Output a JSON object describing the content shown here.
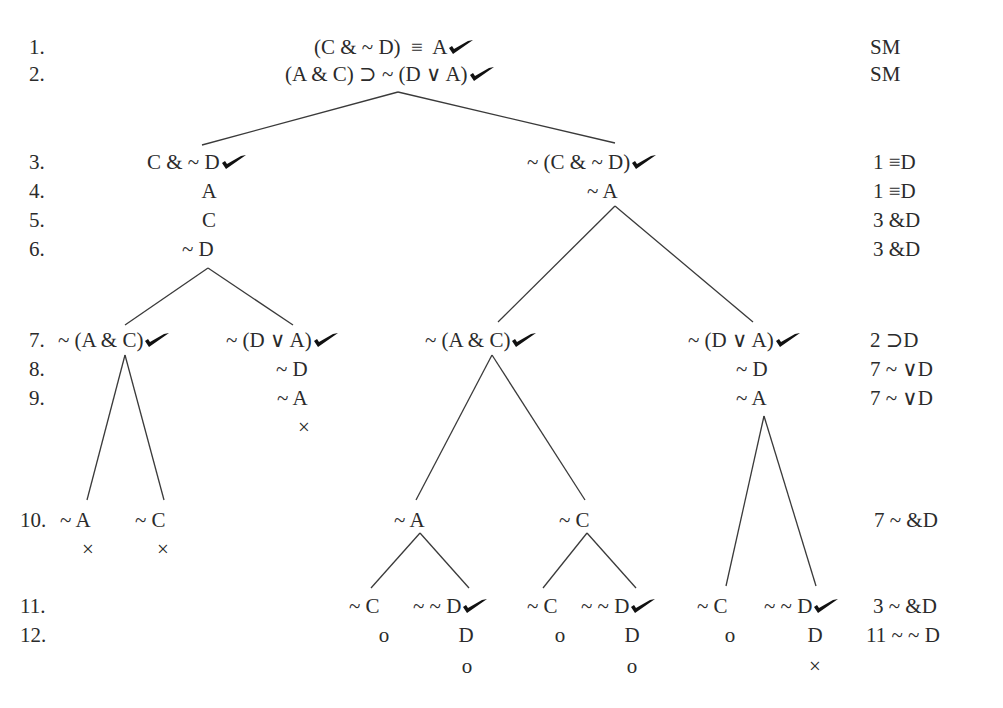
{
  "lines": [
    {
      "num": "1.",
      "justification": "SM"
    },
    {
      "num": "2.",
      "justification": "SM"
    },
    {
      "num": "3.",
      "justification": "1 ≡D"
    },
    {
      "num": "4.",
      "justification": "1 ≡D"
    },
    {
      "num": "5.",
      "justification": "3 &D"
    },
    {
      "num": "6.",
      "justification": "3 &D"
    },
    {
      "num": "7.",
      "justification": "2 ⊃D"
    },
    {
      "num": "8.",
      "justification": "7 ~ ∨D"
    },
    {
      "num": "9.",
      "justification": "7 ~ ∨D"
    },
    {
      "num": "10.",
      "justification": "7 ~ &D"
    },
    {
      "num": "11.",
      "justification": "3 ~ &D"
    },
    {
      "num": "12.",
      "justification": "11 ~ ~ D"
    }
  ],
  "nodes": {
    "root1": "(C & ~ D)  ≡  A",
    "root2": "(A & C) ⊃ ~ (D ∨ A)",
    "l3": "C & ~ D",
    "l4": "A",
    "l5": "C",
    "l6": "~ D",
    "r3": "~ (C & ~ D)",
    "r4": "~ A",
    "ll7": "~ (A & C)",
    "lr7": "~ (D ∨ A)",
    "lr8": "~ D",
    "lr9": "~ A",
    "lr_close": "×",
    "lll10": "~ A",
    "lll_close": "×",
    "llr10": "~ C",
    "llr_close": "×",
    "rl7": "~ (A & C)",
    "rr7": "~ (D ∨ A)",
    "rr8": "~ D",
    "rr9": "~ A",
    "rll10": "~ A",
    "rlr10": "~ C",
    "rll11a": "~ C",
    "rll11b": "~ ~ D",
    "rll12a": "o",
    "rll12b": "D",
    "rll13b": "o",
    "rlr11a": "~ C",
    "rlr11b": "~ ~ D",
    "rlr12a": "o",
    "rlr12b": "D",
    "rlr13b": "o",
    "rr11a": "~ C",
    "rr11b": "~ ~ D",
    "rr12a": "o",
    "rr12b": "D",
    "rr13b": "×"
  },
  "icons": {
    "checkmark": "check-mark-icon",
    "closed": "x-close-mark",
    "open": "o-open-mark"
  },
  "colors": {
    "ink": "#2b2b2b",
    "line": "#3a3a3a",
    "background": "#ffffff"
  }
}
